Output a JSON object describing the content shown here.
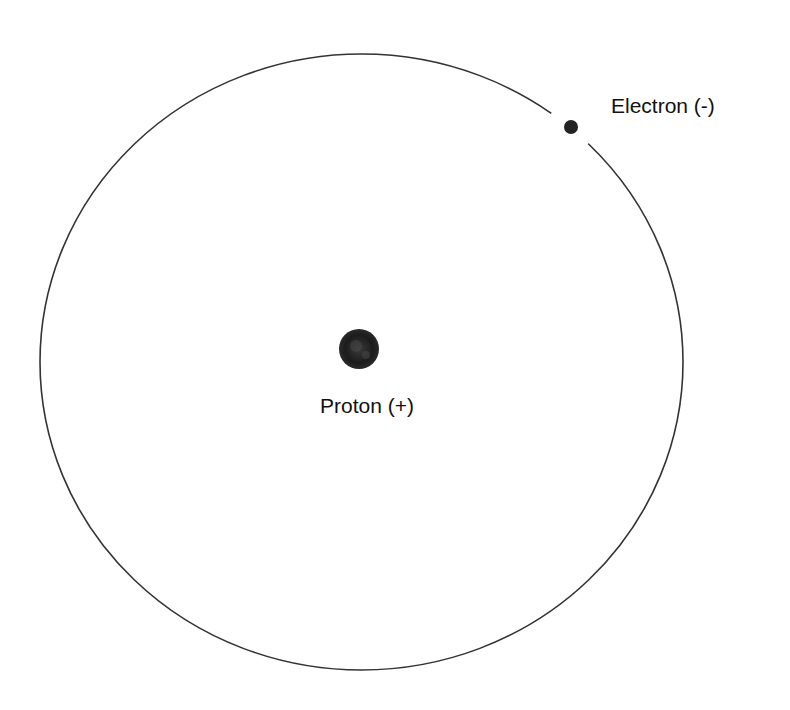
{
  "diagram": {
    "labels": {
      "electron": "Electron (-)",
      "proton": "Proton (+)"
    },
    "orbit": {
      "cx": 361.5,
      "cy": 362,
      "rx": 321.5,
      "ry": 308,
      "stroke": "#333333"
    },
    "electron": {
      "cx": 571,
      "cy": 127,
      "r": 7,
      "fill": "#222222"
    },
    "proton": {
      "cx": 359,
      "cy": 349,
      "r": 20,
      "fill": "#1a1a1a"
    }
  }
}
